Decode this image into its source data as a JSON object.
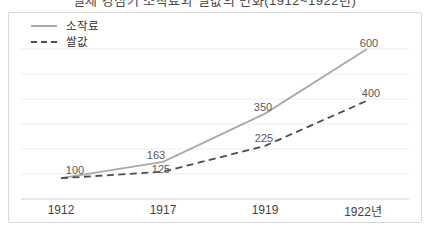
{
  "clipped_top_caption": "일제 강점기 소작료와 쌀값의 변화(1912~1922년)",
  "panel": {
    "background": "#ffffff",
    "border_color": "#d9d9d9"
  },
  "legend": {
    "position": "top-left",
    "items": [
      {
        "label": "소작료",
        "line_style": "solid"
      },
      {
        "label": "쌀값",
        "line_style": "dashed"
      }
    ]
  },
  "chart_data": {
    "type": "line",
    "x": [
      "1912",
      "1917",
      "1919",
      "1922년"
    ],
    "series": [
      {
        "name": "소작료",
        "line_style": "solid",
        "color": "#a9aba3",
        "values": [
          100,
          163,
          350,
          600
        ]
      },
      {
        "name": "쌀값",
        "line_style": "dashed",
        "color": "#4d4d4d",
        "values": [
          100,
          125,
          225,
          400
        ]
      }
    ],
    "point_labels_visible": true,
    "shared_start_label": 100,
    "ylim": [
      0,
      620
    ],
    "grid": "horizontal",
    "gridline_color": "#ededed",
    "axis_line_color": "#d2d2d2",
    "point_label_color": "#595959",
    "tick_label_color": "#424242",
    "legend_position": "top-left"
  }
}
